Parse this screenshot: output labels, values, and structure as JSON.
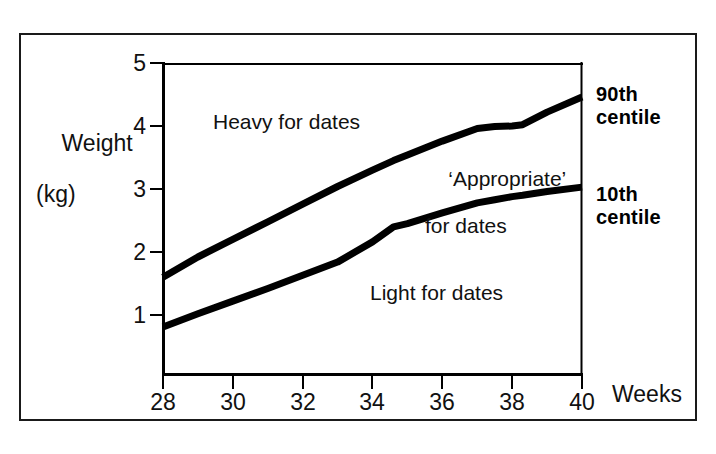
{
  "figure": {
    "frame_color": "#1a1a1a",
    "background": "#ffffff",
    "line_color": "#000000"
  },
  "axes": {
    "y_label_line1": "Weight",
    "y_label_line2": "(kg)",
    "x_unit_label": "Weeks",
    "y_ticks": [
      "1",
      "2",
      "3",
      "4",
      "5"
    ],
    "x_ticks": [
      "28",
      "30",
      "32",
      "34",
      "36",
      "38",
      "40"
    ]
  },
  "annotations": {
    "heavy": "Heavy for dates",
    "appropriate_line1": "‘Appropriate’",
    "appropriate_line2": "for dates",
    "light": "Light for dates",
    "callout_90_line1": "90th",
    "callout_90_line2": "centile",
    "callout_10_line1": "10th",
    "callout_10_line2": "centile"
  },
  "chart_data": {
    "type": "line",
    "title": "",
    "xlabel": "Weeks",
    "ylabel": "Weight (kg)",
    "xlim": [
      28,
      40
    ],
    "ylim": [
      0,
      5
    ],
    "xticks": [
      28,
      30,
      32,
      34,
      36,
      38,
      40
    ],
    "yticks": [
      1,
      2,
      3,
      4,
      5
    ],
    "grid": false,
    "legend_position": "right-outside",
    "x": [
      28,
      29,
      30,
      31,
      32,
      33,
      34,
      34.6,
      35,
      36,
      37,
      37.5,
      38,
      38.3,
      39,
      40
    ],
    "series": [
      {
        "name": "90th centile",
        "values": [
          1.6,
          1.92,
          2.2,
          2.48,
          2.76,
          3.04,
          3.3,
          3.45,
          3.54,
          3.76,
          3.96,
          3.99,
          4.0,
          4.02,
          4.22,
          4.46
        ]
      },
      {
        "name": "10th centile",
        "values": [
          0.81,
          1.02,
          1.22,
          1.42,
          1.63,
          1.84,
          2.16,
          2.4,
          2.45,
          2.62,
          2.78,
          2.83,
          2.88,
          2.9,
          2.96,
          3.03
        ]
      }
    ],
    "regions": [
      {
        "label": "Heavy for dates",
        "position": "above 90th centile"
      },
      {
        "label": "‘Appropriate’ for dates",
        "position": "between 10th and 90th centile"
      },
      {
        "label": "Light for dates",
        "position": "below 10th centile"
      }
    ]
  },
  "geometry": {
    "plot_left": 163,
    "plot_right": 582,
    "plot_top": 63,
    "plot_bottom": 375,
    "y_value_top": 5,
    "y_px_per_unit": 63,
    "y_px_at_1": 315
  }
}
